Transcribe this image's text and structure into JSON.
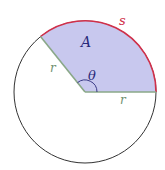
{
  "diagram": {
    "type": "circle-sector",
    "labels": {
      "area": "A",
      "arc": "s",
      "radius_left": "r",
      "radius_right": "r",
      "angle": "θ"
    },
    "colors": {
      "sector_fill": "#c8c8ee",
      "arc_stroke": "#d0304a",
      "radius_stroke": "#8aa888",
      "circle_stroke": "#333333",
      "area_label": "#2a2a7a",
      "arc_label": "#d0304a",
      "radius_label": "#6f8f6f",
      "angle_label": "#2a2a7a"
    },
    "angle_degrees": 129
  }
}
